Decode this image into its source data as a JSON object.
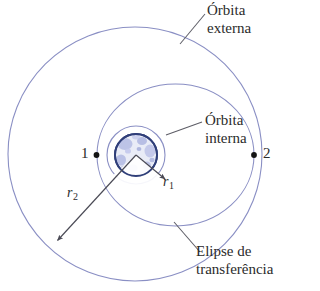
{
  "figure": {
    "title_caption": "",
    "labels": {
      "outer_orbit_line1": "Órbita",
      "outer_orbit_line2": "externa",
      "inner_orbit_line1": "Órbita",
      "inner_orbit_line2": "interna",
      "transfer_line1": "Elipse de",
      "transfer_line2": "transferência",
      "point_1": "1",
      "point_2": "2",
      "radius_inner": "r",
      "radius_inner_sub": "1",
      "radius_outer": "r",
      "radius_outer_sub": "2"
    },
    "colors": {
      "orbit_stroke": "#8a8fc4",
      "leader_stroke": "#6f6f78",
      "planet_outline": "#2f3d77",
      "planet_fill": "#e8eaf6",
      "planet_mottle": "#9fa8dc",
      "text": "#2b2b2b",
      "background": "#ffffff",
      "point_marker": "#1a1a1a"
    },
    "geometry": {
      "outer_orbit": {
        "type": "circle",
        "cx": 135,
        "cy": 154,
        "r": 127
      },
      "inner_orbit": {
        "type": "circle",
        "cx": 136,
        "cy": 155,
        "r": 29
      },
      "transfer_ellipse": {
        "type": "ellipse",
        "cx": 175,
        "cy": 155,
        "rx": 79,
        "ry": 71
      },
      "planet": {
        "type": "circle",
        "cx": 136,
        "cy": 155,
        "r": 21
      },
      "point_1_marker": {
        "x": 97,
        "y": 155
      },
      "point_2_marker": {
        "x": 254,
        "y": 155
      },
      "r1_vector": {
        "x1": 136,
        "y1": 155,
        "x2": 166,
        "y2": 180
      },
      "r2_vector": {
        "x1": 136,
        "y1": 155,
        "x2": 56,
        "y2": 242
      }
    }
  }
}
